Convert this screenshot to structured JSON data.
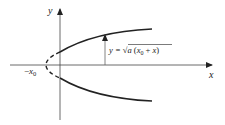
{
  "diagram": {
    "type": "parabola-sketch",
    "axes": {
      "x_label": "x",
      "y_label": "y"
    },
    "vertex_label": {
      "minus": "−",
      "var": "x",
      "sub": "0"
    },
    "formula": {
      "lhs": "y = ",
      "sqrt": "√",
      "radicand_a": "a",
      "open": " (",
      "x": "x",
      "sub": "0",
      "plus": " + ",
      "x2": "x",
      "close": ")"
    },
    "colors": {
      "stroke": "#222222",
      "background": "#ffffff"
    }
  }
}
